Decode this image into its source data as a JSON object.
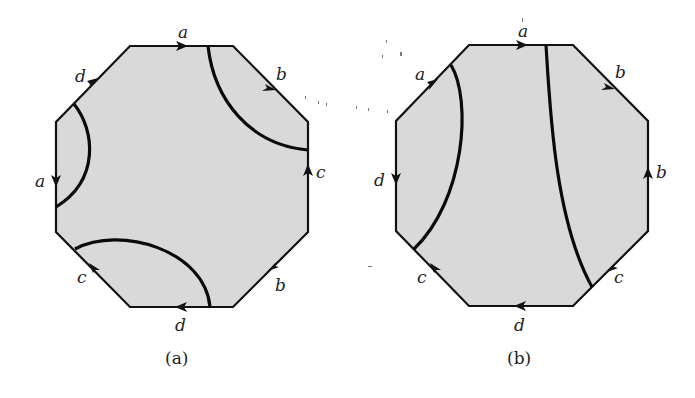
{
  "figure": {
    "panels": [
      {
        "id": "a",
        "caption": "(a)",
        "edges": {
          "top": "a",
          "upper_left": "d",
          "left": "a",
          "lower_left": "c",
          "bottom": "d",
          "lower_right": "b",
          "right": "c",
          "upper_right": "b"
        },
        "curves": 3
      },
      {
        "id": "b",
        "caption": "(b)",
        "edges": {
          "top": "a",
          "upper_left": "a",
          "left": "d",
          "lower_left": "c",
          "bottom": "d",
          "lower_right": "c",
          "right": "b",
          "upper_right": "b"
        },
        "curves": 2
      }
    ],
    "colors": {
      "fill": "#d9d9d9",
      "stroke": "#111111"
    }
  }
}
